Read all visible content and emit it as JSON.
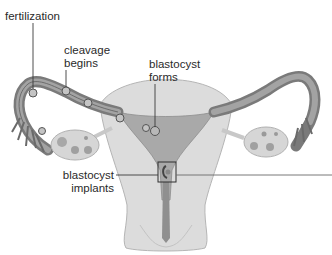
{
  "diagram": {
    "type": "anatomical-illustration",
    "colors": {
      "tube_dark": "#6e6e6e",
      "tube_mid": "#9a9a9a",
      "uterus_fill": "#d8d8d8",
      "uterus_light": "#e6e6e6",
      "cavity": "#a8a8a8",
      "ovary": "#d6d6d6",
      "leader": "#3a3a3a",
      "text": "#2a2a2a"
    },
    "labels": {
      "fertilization": {
        "line1": "fertilization"
      },
      "cleavage": {
        "line1": "cleavage",
        "line2": "begins"
      },
      "blastocyst_forms": {
        "line1": "blastocyst",
        "line2": "forms"
      },
      "blastocyst_implants": {
        "line1": "blastocyst",
        "line2": "implants"
      }
    }
  }
}
